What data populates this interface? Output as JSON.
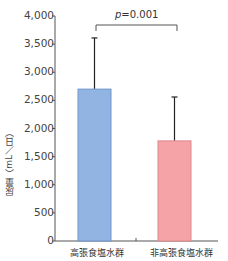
{
  "chart_data": {
    "type": "bar",
    "title": "",
    "xlabel": "",
    "ylabel": "尿量（mL／日）",
    "ylim": [
      0,
      4000
    ],
    "yticks": [
      "0",
      "500",
      "1,000",
      "1,500",
      "2,000",
      "2,500",
      "3,000",
      "3,500",
      "4,000"
    ],
    "categories": [
      "高張食塩水群",
      "非高張食塩水群"
    ],
    "values": [
      2700,
      1780
    ],
    "error_upper": [
      3610,
      2560
    ],
    "colors": [
      "#92b4e3",
      "#f5a3a6"
    ],
    "annotation": {
      "type": "significance-bracket",
      "label_prefix": "p",
      "label_value": "=0.001",
      "between": [
        0,
        1
      ]
    },
    "grid": false,
    "legend": null
  }
}
